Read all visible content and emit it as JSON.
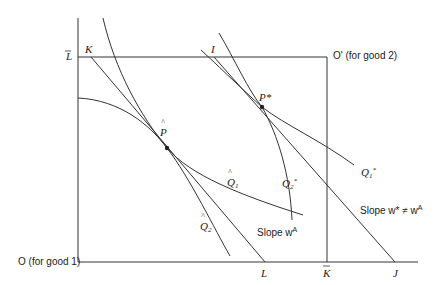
{
  "diagram": {
    "type": "edgeworth-box",
    "origins": {
      "good1": "O (for good 1)",
      "good2": "O' (for good 2)"
    },
    "axis_labels": {
      "L_bar": "L",
      "K_bar": "K",
      "L": "L",
      "J": "J",
      "K": "K",
      "I": "I"
    },
    "points": {
      "P_hat": "P",
      "P_star": "P*"
    },
    "curves": {
      "Q1_hat": "Q",
      "Q1_hat_sub": "1",
      "Q2_hat": "Q",
      "Q2_hat_sub": "2",
      "Q1_star": "Q",
      "Q1_star_sub": "1",
      "Q1_star_sup": "*",
      "Q2_star": "Q",
      "Q2_star_sub": "2",
      "Q2_star_sup": "*"
    },
    "annotations": {
      "slope_autarky": "Slope w",
      "slope_autarky_sup": "A",
      "slope_trade": "Slope w* ≠ w",
      "slope_trade_sup": "A"
    },
    "colors": {
      "line": "#333333",
      "background": "#ffffff"
    }
  }
}
